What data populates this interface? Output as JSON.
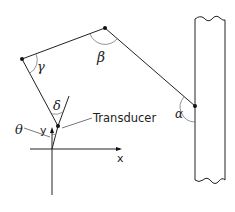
{
  "diagram": {
    "title": "",
    "labels": {
      "alpha": "α",
      "beta": "β",
      "gamma": "γ",
      "delta": "δ",
      "theta": "θ",
      "transducer": "Transducer",
      "x_axis": "x",
      "y_axis": "y"
    },
    "nodes": [
      {
        "id": "wall-joint",
        "x": 195,
        "y": 106
      },
      {
        "id": "top-joint",
        "x": 105,
        "y": 28
      },
      {
        "id": "left-joint",
        "x": 22,
        "y": 59
      },
      {
        "id": "transducer-point",
        "x": 58,
        "y": 126
      },
      {
        "id": "origin",
        "x": 52,
        "y": 149
      }
    ],
    "edges": [
      {
        "from": "wall-joint",
        "to": "top-joint"
      },
      {
        "from": "top-joint",
        "to": "left-joint"
      },
      {
        "from": "left-joint",
        "to": "transducer-point"
      },
      {
        "from": "transducer-point",
        "to": "origin"
      }
    ],
    "angles": [
      {
        "name": "alpha",
        "at": "wall-joint"
      },
      {
        "name": "beta",
        "at": "top-joint"
      },
      {
        "name": "gamma",
        "at": "left-joint"
      },
      {
        "name": "delta",
        "at": "transducer-point"
      },
      {
        "name": "theta",
        "at": "origin"
      }
    ],
    "wall": {
      "left_x": 195,
      "right_x": 225,
      "top_y": 19,
      "bottom_y": 180
    }
  }
}
